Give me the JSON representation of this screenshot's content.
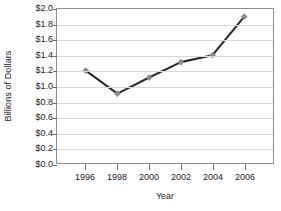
{
  "chart_data": {
    "type": "line",
    "title": "",
    "xlabel": "Year",
    "ylabel": "Billions of Dollars",
    "categories": [
      "1996",
      "1998",
      "2000",
      "2002",
      "2004",
      "2006"
    ],
    "x": [
      1996,
      1998,
      2000,
      2002,
      2004,
      2006
    ],
    "values": [
      1.2,
      0.9,
      1.11,
      1.31,
      1.4,
      1.9
    ],
    "series": [
      {
        "name": "Billions of Dollars",
        "values": [
          1.2,
          0.9,
          1.11,
          1.31,
          1.4,
          1.9
        ]
      }
    ],
    "ylim": [
      0.0,
      2.0
    ],
    "ytick_values": [
      0.0,
      0.2,
      0.4,
      0.6,
      0.8,
      1.0,
      1.2,
      1.4,
      1.6,
      1.8,
      2.0
    ],
    "ytick_labels": [
      "$0.0",
      "$0.2",
      "$0.4",
      "$0.6",
      "$0.8",
      "$1.0",
      "$1.2",
      "$1.4",
      "$1.6",
      "$1.8",
      "$2.0"
    ],
    "xtick_labels": [
      "1996",
      "1998",
      "2000",
      "2002",
      "2004",
      "2006"
    ],
    "grid": true,
    "grid_axis": "y",
    "legend": false,
    "legend_position": "none",
    "marker": "diamond",
    "line_color": "#2b2b2b",
    "marker_color": "#8c8c8c",
    "grid_color": "#d9d9d9",
    "frame_color": "#8f8f8f",
    "text_color": "#1a1a1a"
  }
}
